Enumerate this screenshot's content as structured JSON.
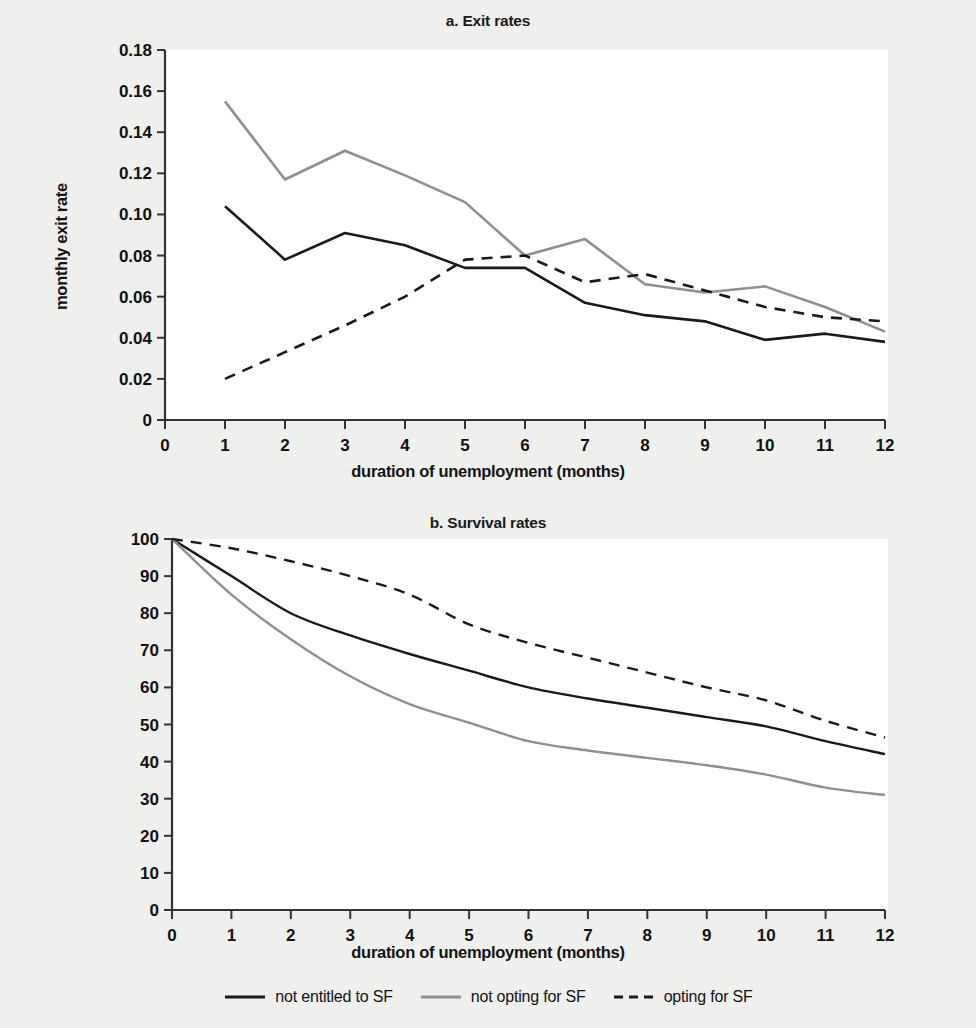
{
  "figure": {
    "background_color": "#efefed",
    "plot_background_color": "#ffffff"
  },
  "colors": {
    "not_entitled": "#1a1a1a",
    "not_opting": "#8f8f8f",
    "opting": "#1a1a1a"
  },
  "legend": {
    "items": [
      {
        "label": "not entitled to SF",
        "style": "solid",
        "color": "#1a1a1a"
      },
      {
        "label": "not opting for SF",
        "style": "solid",
        "color": "#8f8f8f"
      },
      {
        "label": "opting for SF",
        "style": "dashed",
        "color": "#1a1a1a"
      }
    ]
  },
  "panel_a": {
    "title": "a. Exit rates",
    "xlabel": "duration of unemployment (months)",
    "ylabel": "monthly exit rate"
  },
  "panel_b": {
    "title": "b. Survival rates",
    "xlabel": "duration of unemployment (months)",
    "ylabel": "survival rate"
  },
  "chart_data": [
    {
      "type": "line",
      "title": "a. Exit rates",
      "xlabel": "duration of unemployment (months)",
      "ylabel": "monthly exit rate",
      "x": [
        1,
        2,
        3,
        4,
        5,
        6,
        7,
        8,
        9,
        10,
        11,
        12
      ],
      "xlim": [
        0,
        12
      ],
      "ylim": [
        0,
        0.18
      ],
      "xticks": [
        "0",
        "1",
        "2",
        "3",
        "4",
        "5",
        "6",
        "7",
        "8",
        "9",
        "10",
        "11",
        "12"
      ],
      "yticks": [
        "0",
        "0.02",
        "0.04",
        "0.06",
        "0.08",
        "0.10",
        "0.12",
        "0.14",
        "0.16",
        "0.18"
      ],
      "grid": false,
      "legend_position": "bottom-figure",
      "series": [
        {
          "name": "not entitled to SF",
          "style": "solid",
          "color": "#1a1a1a",
          "values": [
            0.104,
            0.078,
            0.091,
            0.085,
            0.074,
            0.074,
            0.057,
            0.051,
            0.048,
            0.039,
            0.042,
            0.038
          ]
        },
        {
          "name": "not opting for SF",
          "style": "solid",
          "color": "#8f8f8f",
          "values": [
            0.155,
            0.117,
            0.131,
            0.119,
            0.106,
            0.08,
            0.088,
            0.066,
            0.062,
            0.065,
            0.055,
            0.043
          ]
        },
        {
          "name": "opting for SF",
          "style": "dashed",
          "color": "#1a1a1a",
          "values": [
            0.02,
            0.033,
            0.046,
            0.06,
            0.078,
            0.08,
            0.067,
            0.071,
            0.063,
            0.055,
            0.05,
            0.048
          ]
        }
      ]
    },
    {
      "type": "line",
      "title": "b. Survival rates",
      "xlabel": "duration of unemployment (months)",
      "ylabel": "survival rate",
      "x": [
        0,
        1,
        2,
        3,
        4,
        5,
        6,
        7,
        8,
        9,
        10,
        11,
        12
      ],
      "xlim": [
        0,
        12
      ],
      "ylim": [
        0,
        100
      ],
      "xticks": [
        "0",
        "1",
        "2",
        "3",
        "4",
        "5",
        "6",
        "7",
        "8",
        "9",
        "10",
        "11",
        "12"
      ],
      "yticks": [
        "0",
        "10",
        "20",
        "30",
        "40",
        "50",
        "60",
        "70",
        "80",
        "90",
        "100"
      ],
      "grid": false,
      "legend_position": "bottom-figure",
      "series": [
        {
          "name": "not entitled to SF",
          "style": "solid",
          "color": "#1a1a1a",
          "values": [
            100,
            90,
            80,
            74,
            69,
            64.5,
            60,
            57,
            54.5,
            52,
            49.5,
            45.5,
            42
          ]
        },
        {
          "name": "not opting for SF",
          "style": "solid",
          "color": "#8f8f8f",
          "values": [
            100,
            85,
            73,
            63,
            55.5,
            50.5,
            45.5,
            43,
            41,
            39,
            36.5,
            33,
            31
          ]
        },
        {
          "name": "opting for SF",
          "style": "dashed",
          "color": "#1a1a1a",
          "values": [
            100,
            97.5,
            94,
            90,
            85,
            77,
            72,
            68,
            64,
            60,
            56.5,
            51,
            46.5
          ]
        }
      ]
    }
  ]
}
